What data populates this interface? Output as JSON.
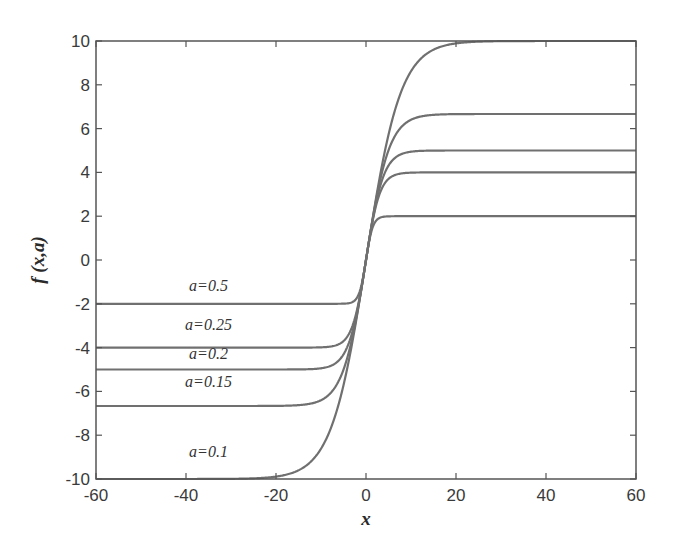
{
  "chart_data": {
    "type": "line",
    "title": "",
    "xlabel": "x",
    "ylabel": "f (x,a)",
    "xlim": [
      -60,
      60
    ],
    "ylim": [
      -10,
      10
    ],
    "xticks": [
      -60,
      -40,
      -20,
      0,
      20,
      40,
      60
    ],
    "yticks": [
      10,
      8,
      6,
      4,
      2,
      0,
      -2,
      -4,
      -6,
      -8,
      -10
    ],
    "grid": false,
    "legend": "inline labels on left side of plot",
    "model": "f(x,a) = (1/a) * tanh(1.3 * a * x)  (saturates at +/- 1/a)",
    "series": [
      {
        "name": "a=0.1",
        "a": 0.1,
        "lower_asymptote": -10,
        "upper_asymptote": 10,
        "x": [
          -60,
          -40,
          -20,
          -10,
          -5,
          0,
          5,
          10,
          20,
          40,
          60
        ],
        "values": [
          -10,
          -10,
          -9.9,
          -8.6,
          -5.8,
          0,
          5.8,
          8.6,
          9.9,
          10,
          10
        ]
      },
      {
        "name": "a=0.15",
        "a": 0.15,
        "lower_asymptote": -6.67,
        "upper_asymptote": 6.67,
        "x": [
          -60,
          -40,
          -20,
          -10,
          -5,
          0,
          5,
          10,
          20,
          40,
          60
        ],
        "values": [
          -6.67,
          -6.67,
          -6.67,
          -6.4,
          -5.0,
          0,
          5.0,
          6.4,
          6.67,
          6.67,
          6.67
        ]
      },
      {
        "name": "a=0.2",
        "a": 0.2,
        "lower_asymptote": -5,
        "upper_asymptote": 5,
        "x": [
          -60,
          -40,
          -20,
          -10,
          -5,
          0,
          5,
          10,
          20,
          40,
          60
        ],
        "values": [
          -5,
          -5,
          -5,
          -4.9,
          -4.3,
          0,
          4.3,
          4.9,
          5,
          5,
          5
        ]
      },
      {
        "name": "a=0.25",
        "a": 0.25,
        "lower_asymptote": -4,
        "upper_asymptote": 4,
        "x": [
          -60,
          -40,
          -20,
          -10,
          -5,
          0,
          5,
          10,
          20,
          40,
          60
        ],
        "values": [
          -4,
          -4,
          -4,
          -4,
          -3.7,
          0,
          3.7,
          4,
          4,
          4,
          4
        ]
      },
      {
        "name": "a=0.5",
        "a": 0.5,
        "lower_asymptote": -2,
        "upper_asymptote": 2,
        "x": [
          -60,
          -40,
          -20,
          -10,
          -5,
          0,
          5,
          10,
          20,
          40,
          60
        ],
        "values": [
          -2,
          -2,
          -2,
          -2,
          -2,
          0,
          2,
          2,
          2,
          2,
          2
        ]
      }
    ],
    "annotations": [
      {
        "text": "a=0.5",
        "x": -35,
        "y": -1.4
      },
      {
        "text": "a=0.25",
        "x": -35,
        "y": -3.2
      },
      {
        "text": "a=0.2",
        "x": -35,
        "y": -4.5
      },
      {
        "text": "a=0.15",
        "x": -35,
        "y": -5.8
      },
      {
        "text": "a=0.1",
        "x": -35,
        "y": -9.0
      }
    ],
    "colors": {
      "curve": "#707070",
      "frame": "#555555",
      "text": "#333333"
    }
  }
}
